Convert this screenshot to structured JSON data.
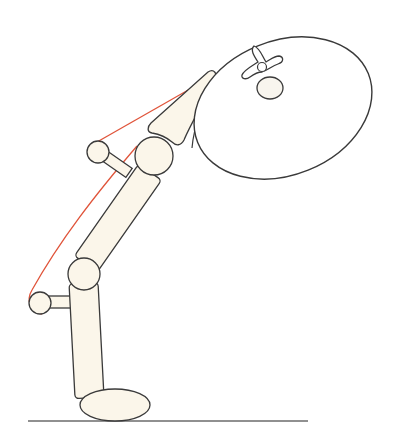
{
  "figure": {
    "colors": {
      "background": "#ffffff",
      "stroke": "#3a3a3a",
      "fill": "#fbf6ea",
      "tension_line": "#e0543a",
      "ground": "#6b6b6b"
    },
    "parts": [
      "ground-line",
      "foot",
      "shin",
      "knee-joint",
      "lower-rod-knob",
      "thigh",
      "hip-joint",
      "upper-rod-knob",
      "wedge",
      "load-ellipse",
      "vertebra"
    ]
  }
}
